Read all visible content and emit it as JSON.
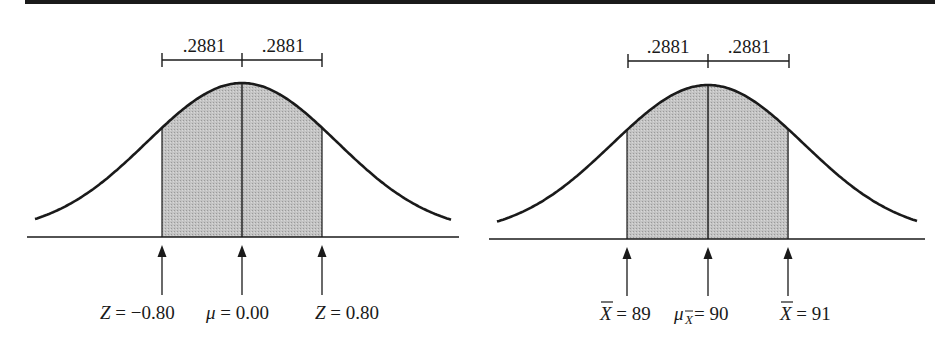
{
  "figure": {
    "top_rule": true,
    "colors": {
      "ink": "#1a1a1a",
      "shade": "#bdbdbd",
      "background": "#ffffff"
    }
  },
  "left_panel": {
    "title": "Standard normal (Z) distribution",
    "area_labels": [
      ".2881",
      ".2881"
    ],
    "markers": [
      {
        "symbol": "Z",
        "eq": " = ",
        "value": "−0.80"
      },
      {
        "symbol": "μ",
        "eq": " = ",
        "value": "0.00"
      },
      {
        "symbol": "Z",
        "eq": " = ",
        "value": "0.80"
      }
    ]
  },
  "right_panel": {
    "title": "Sampling distribution of the mean",
    "area_labels": [
      ".2881",
      ".2881"
    ],
    "markers": [
      {
        "symbol": "X",
        "overline": true,
        "eq": " = ",
        "value": "89"
      },
      {
        "symbol": "μ",
        "subscript": "X",
        "eq": " = ",
        "value": "90"
      },
      {
        "symbol": "X",
        "overline": true,
        "eq": " = ",
        "value": "91"
      }
    ]
  },
  "chart_data": [
    {
      "type": "area",
      "title": "Standard normal curve with shaded area between Z = -0.80 and Z = 0.80",
      "x": [
        -0.8,
        0.0,
        0.8
      ],
      "shaded_range": [
        -0.8,
        0.8
      ],
      "areas": [
        {
          "from": -0.8,
          "to": 0.0,
          "value": 0.2881
        },
        {
          "from": 0.0,
          "to": 0.8,
          "value": 0.2881
        }
      ],
      "annotations": [
        "Z = −0.80",
        "μ = 0.00",
        "Z = 0.80",
        ".2881",
        ".2881"
      ],
      "xlabel": "",
      "ylabel": "",
      "grid": false
    },
    {
      "type": "area",
      "title": "Sampling distribution of X̄ with shaded area between 89 and 91",
      "x": [
        89,
        90,
        91
      ],
      "shaded_range": [
        89,
        91
      ],
      "areas": [
        {
          "from": 89,
          "to": 90,
          "value": 0.2881
        },
        {
          "from": 90,
          "to": 91,
          "value": 0.2881
        }
      ],
      "annotations": [
        "X̄ = 89",
        "μ_X̄ = 90",
        "X̄ = 91",
        ".2881",
        ".2881"
      ],
      "xlabel": "",
      "ylabel": "",
      "grid": false
    }
  ]
}
